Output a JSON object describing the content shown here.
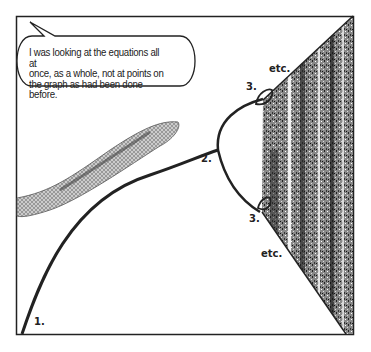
{
  "speech_bubble": {
    "lines": [
      "I was looking at the equations all at",
      "once, as a whole, not at points on",
      "the graph as had been done before."
    ]
  },
  "labels": {
    "point_1": "1.",
    "point_2": "2.",
    "point_3_upper": "3.",
    "point_3_lower": "3.",
    "etc_upper": "etc.",
    "etc_lower": "etc."
  },
  "illustration": {
    "subject": "snake",
    "diagram": "bifurcation-diagram"
  },
  "colors": {
    "ink": "#222222",
    "background": "#ffffff"
  }
}
